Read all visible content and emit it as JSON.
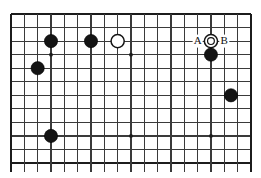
{
  "diagram": {
    "type": "go-board-diagram",
    "board": {
      "columns": 19,
      "rows": 12,
      "origin_x": 11,
      "origin_y": 14,
      "spacing_x": 13.33,
      "spacing_y": 13.55,
      "line_color": "#3a3a3a",
      "edge_color": "#1c1c1c",
      "background_color": "#ffffff",
      "bottom_overhang": 9
    },
    "star_points": [
      {
        "col": 3,
        "row": 3
      },
      {
        "col": 9,
        "row": 3
      },
      {
        "col": 9,
        "row": 9
      },
      {
        "col": 15,
        "row": 9
      }
    ],
    "stones": [
      {
        "id": "b1",
        "color": "black",
        "col": 3,
        "row": 2
      },
      {
        "id": "b2",
        "color": "black",
        "col": 6,
        "row": 2
      },
      {
        "id": "w1",
        "color": "white",
        "col": 8,
        "row": 2,
        "marked": false
      },
      {
        "id": "w2",
        "color": "white",
        "col": 15,
        "row": 2,
        "marked": true,
        "mark": "circle"
      },
      {
        "id": "b3",
        "color": "black",
        "col": 15,
        "row": 3
      },
      {
        "id": "b4",
        "color": "black",
        "col": 2,
        "row": 4
      },
      {
        "id": "b5",
        "color": "black",
        "col": 16.5,
        "row": 6
      },
      {
        "id": "b6",
        "color": "black",
        "col": 3,
        "row": 9
      }
    ],
    "point_labels": [
      {
        "id": "labelA",
        "text": "A",
        "col": 14,
        "row": 2
      },
      {
        "id": "labelB",
        "text": "B",
        "col": 16,
        "row": 2
      }
    ],
    "colors": {
      "black_stone": "#141414",
      "white_stone": "#ffffff",
      "stone_outline": "#141414",
      "grid": "#3a3a3a",
      "label_text": "#111111",
      "page_background": "#ffffff"
    },
    "stone_radius": 6.6,
    "star_radius": 1.9,
    "mark_radius": 3.4
  }
}
